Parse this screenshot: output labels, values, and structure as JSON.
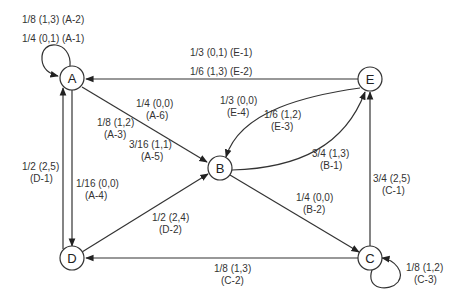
{
  "diagram": {
    "type": "state-transition-graph",
    "nodes": [
      {
        "id": "A",
        "label": "A"
      },
      {
        "id": "B",
        "label": "B"
      },
      {
        "id": "C",
        "label": "C"
      },
      {
        "id": "D",
        "label": "D"
      },
      {
        "id": "E",
        "label": "E"
      }
    ],
    "edges": [
      {
        "from": "A",
        "to": "A",
        "label_line1": "1/8 (1,3) (A-2)",
        "label_line2": ""
      },
      {
        "from": "A",
        "to": "A",
        "label_line1": "1/4 (0,1) (A-1)",
        "label_line2": ""
      },
      {
        "from": "E",
        "to": "A",
        "label_line1": "1/3 (0,1) (E-1)",
        "label_line2": ""
      },
      {
        "from": "E",
        "to": "A",
        "label_line1": "1/6 (1,3) (E-2)",
        "label_line2": ""
      },
      {
        "from": "A",
        "to": "B",
        "label_line1": "1/4 (0,0)",
        "label_line2": "(A-6)"
      },
      {
        "from": "A",
        "to": "B",
        "label_line1": "1/8 (1,2)",
        "label_line2": "(A-3)"
      },
      {
        "from": "A",
        "to": "B",
        "label_line1": "3/16 (1,1)",
        "label_line2": "(A-5)"
      },
      {
        "from": "E",
        "to": "B",
        "label_line1": "1/3 (0,0)",
        "label_line2": "(E-4)"
      },
      {
        "from": "E",
        "to": "B",
        "label_line1": "1/6 (1,2)",
        "label_line2": "(E-3)"
      },
      {
        "from": "B",
        "to": "E",
        "label_line1": "3/4 (1,3)",
        "label_line2": "(B-1)"
      },
      {
        "from": "D",
        "to": "A",
        "label_line1": "1/2 (2,5)",
        "label_line2": "(D-1)"
      },
      {
        "from": "A",
        "to": "D",
        "label_line1": "1/16 (0,0)",
        "label_line2": "(A-4)"
      },
      {
        "from": "D",
        "to": "B",
        "label_line1": "1/2 (2,4)",
        "label_line2": "(D-2)"
      },
      {
        "from": "B",
        "to": "C",
        "label_line1": "1/4 (0,0)",
        "label_line2": "(B-2)"
      },
      {
        "from": "C",
        "to": "E",
        "label_line1": "3/4 (2,5)",
        "label_line2": "(C-1)"
      },
      {
        "from": "C",
        "to": "D",
        "label_line1": "1/8 (1,3)",
        "label_line2": "(C-2)"
      },
      {
        "from": "C",
        "to": "C",
        "label_line1": "1/8 (1,2)",
        "label_line2": "(C-3)"
      }
    ]
  }
}
